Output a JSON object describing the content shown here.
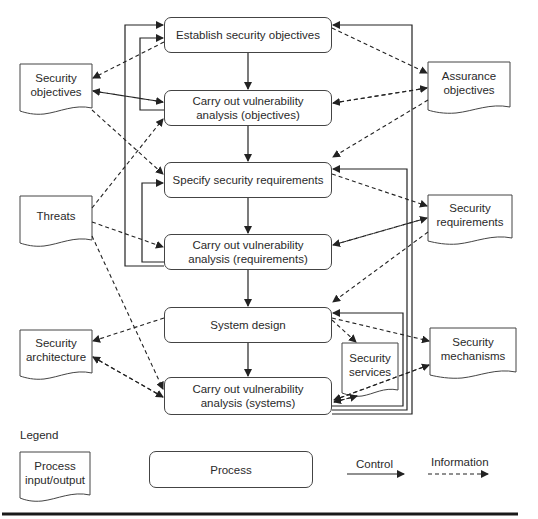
{
  "diagram": {
    "processes": [
      {
        "id": "establish",
        "label": "Establish security objectives"
      },
      {
        "id": "va_objectives",
        "label": "Carry out vulnerability\nanalysis (objectives)"
      },
      {
        "id": "specify",
        "label": "Specify security requirements"
      },
      {
        "id": "va_requirements",
        "label": "Carry out vulnerability\nanalysis (requirements)"
      },
      {
        "id": "system_design",
        "label": "System design"
      },
      {
        "id": "va_systems",
        "label": "Carry out vulnerability\nanalysis (systems)"
      }
    ],
    "documents": [
      {
        "id": "security_objectives",
        "label": "Security\nobjectives"
      },
      {
        "id": "assurance_objectives",
        "label": "Assurance\nobjectives"
      },
      {
        "id": "threats",
        "label": "Threats"
      },
      {
        "id": "security_requirements",
        "label": "Security\nrequirements"
      },
      {
        "id": "security_architecture",
        "label": "Security\narchitecture"
      },
      {
        "id": "security_services",
        "label": "Security\nservices"
      },
      {
        "id": "security_mechanisms",
        "label": "Security\nmechanisms"
      }
    ],
    "edges": {
      "control": [
        [
          "establish",
          "va_objectives"
        ],
        [
          "va_objectives",
          "specify"
        ],
        [
          "specify",
          "va_requirements"
        ],
        [
          "va_requirements",
          "system_design"
        ],
        [
          "system_design",
          "va_systems"
        ],
        [
          "va_objectives",
          "establish"
        ],
        [
          "va_requirements",
          "specify"
        ],
        [
          "va_requirements",
          "establish"
        ],
        [
          "va_systems",
          "system_design"
        ],
        [
          "va_systems",
          "specify"
        ],
        [
          "va_systems",
          "establish"
        ]
      ],
      "information": [
        [
          "establish",
          "security_objectives"
        ],
        [
          "security_objectives",
          "va_objectives"
        ],
        [
          "va_objectives",
          "security_objectives"
        ],
        [
          "security_objectives",
          "specify"
        ],
        [
          "threats",
          "va_objectives"
        ],
        [
          "threats",
          "va_requirements"
        ],
        [
          "threats",
          "va_systems"
        ],
        [
          "establish",
          "assurance_objectives"
        ],
        [
          "assurance_objectives",
          "va_objectives"
        ],
        [
          "va_objectives",
          "assurance_objectives"
        ],
        [
          "assurance_objectives",
          "specify"
        ],
        [
          "specify",
          "security_requirements"
        ],
        [
          "security_requirements",
          "va_requirements"
        ],
        [
          "va_requirements",
          "security_requirements"
        ],
        [
          "security_requirements",
          "system_design"
        ],
        [
          "system_design",
          "security_architecture"
        ],
        [
          "security_architecture",
          "va_systems"
        ],
        [
          "va_systems",
          "security_architecture"
        ],
        [
          "system_design",
          "security_services"
        ],
        [
          "security_services",
          "va_systems"
        ],
        [
          "va_systems",
          "security_services"
        ],
        [
          "system_design",
          "security_mechanisms"
        ],
        [
          "security_mechanisms",
          "va_systems"
        ],
        [
          "va_systems",
          "security_mechanisms"
        ]
      ]
    }
  },
  "legend": {
    "title": "Legend",
    "document_label": "Process\ninput/output",
    "process_label": "Process",
    "control_label": "Control",
    "information_label": "Information"
  }
}
